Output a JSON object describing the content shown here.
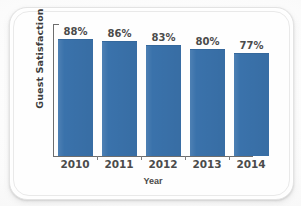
{
  "chart_data": {
    "type": "bar",
    "title": "",
    "xlabel": "Year",
    "ylabel": "Guest Satisfaction",
    "categories": [
      "2010",
      "2011",
      "2012",
      "2013",
      "2014"
    ],
    "values": [
      88,
      86,
      83,
      80,
      77
    ],
    "value_labels": [
      "88%",
      "86%",
      "83%",
      "80%",
      "77%"
    ],
    "ylim": [
      0,
      100
    ],
    "grid": false,
    "legend": false,
    "series_color": "#3a72ab",
    "axis_color": "#6d6d6d",
    "label_color": "#4b4b4b"
  }
}
